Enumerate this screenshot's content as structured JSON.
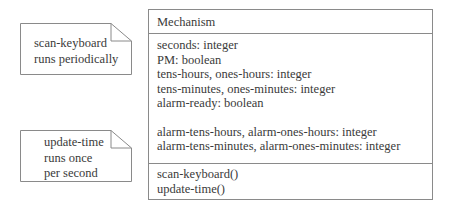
{
  "notes": [
    {
      "lines": [
        "scan-keyboard",
        "runs periodically"
      ]
    },
    {
      "lines": [
        "update-time",
        "runs once",
        "per second"
      ]
    }
  ],
  "class": {
    "name": "Mechanism",
    "attributes_group1": [
      "seconds: integer",
      "PM: boolean",
      "tens-hours, ones-hours: integer",
      "tens-minutes, ones-minutes: integer",
      "alarm-ready: boolean"
    ],
    "attributes_group2": [
      "alarm-tens-hours, alarm-ones-hours: integer",
      "alarm-tens-minutes, alarm-ones-minutes: integer"
    ],
    "methods": [
      "scan-keyboard()",
      "update-time()"
    ]
  },
  "colors": {
    "stroke": "#8a8a8a",
    "text": "#3a3a3a",
    "background": "#ffffff"
  }
}
